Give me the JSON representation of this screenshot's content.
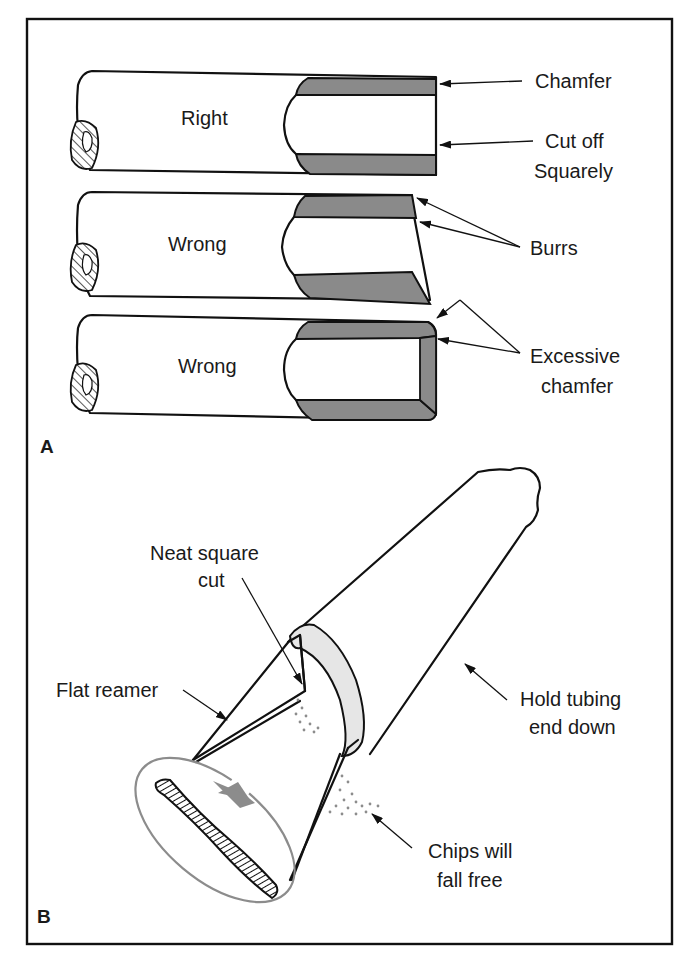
{
  "figure": {
    "panel_a": {
      "label": "A",
      "tubes": [
        {
          "caption": "Right"
        },
        {
          "caption": "Wrong"
        },
        {
          "caption": "Wrong"
        }
      ],
      "callouts": {
        "chamfer": "Chamfer",
        "cut_off_line1": "Cut off",
        "cut_off_line2": "Squarely",
        "burrs": "Burrs",
        "excessive_line1": "Excessive",
        "excessive_line2": "chamfer"
      }
    },
    "panel_b": {
      "label": "B",
      "callouts": {
        "neat_line1": "Neat square",
        "neat_line2": "cut",
        "flat_reamer": "Flat reamer",
        "hold_line1": "Hold tubing",
        "hold_line2": "end down",
        "chips_line1": "Chips will",
        "chips_line2": "fall free"
      }
    },
    "colors": {
      "line": "#111111",
      "wall_fill": "#8a8a8a",
      "gray_accent": "#8c8c8c",
      "background": "#ffffff"
    }
  }
}
